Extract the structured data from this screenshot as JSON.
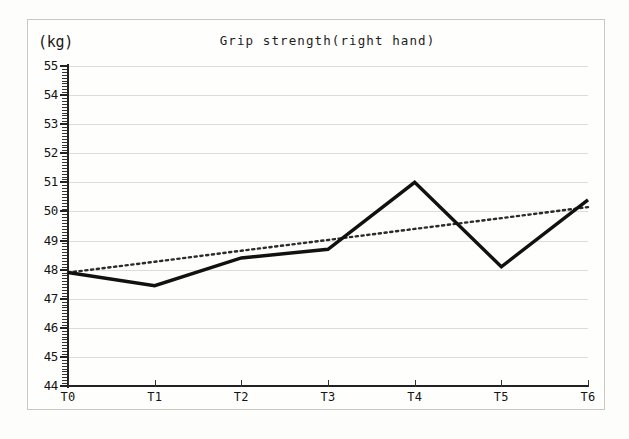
{
  "chart_data": {
    "type": "line",
    "title": "Grip strength(right hand)",
    "ylabel": "(kg)",
    "xlabel": "",
    "categories": [
      "T0",
      "T1",
      "T2",
      "T3",
      "T4",
      "T5",
      "T6"
    ],
    "ylim": [
      44,
      55
    ],
    "ytick_labels": [
      "55",
      "54",
      "53",
      "52",
      "51",
      "50",
      "49",
      "48",
      "47",
      "46",
      "45",
      "44"
    ],
    "ytick_values": [
      55,
      54,
      53,
      52,
      51,
      50,
      49,
      48,
      47,
      46,
      45,
      44
    ],
    "ytick_step": 1,
    "minor_tick_step": 0.1,
    "grid": true,
    "grid_axis": "y",
    "legend": "none",
    "series": [
      {
        "name": "Grip strength",
        "style": "solid",
        "color": "#111111",
        "values": [
          47.9,
          47.45,
          48.4,
          48.7,
          51.0,
          48.1,
          50.4
        ]
      },
      {
        "name": "Linear trendline",
        "style": "dotted",
        "color": "#2b2b2b",
        "values": [
          47.9,
          48.27,
          48.65,
          49.02,
          49.4,
          49.77,
          50.15
        ]
      }
    ]
  },
  "page": {
    "unit_label": "(kg)",
    "title": "Grip strength(right hand)"
  }
}
